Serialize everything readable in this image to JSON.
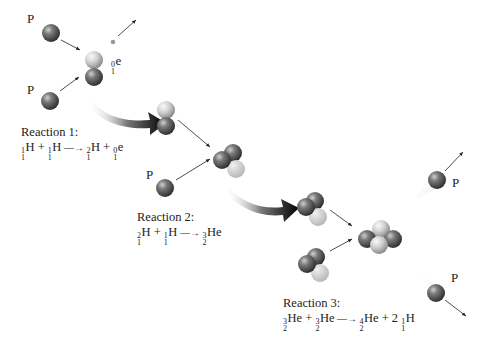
{
  "particle_labels": {
    "proton": "P",
    "positron_sup": "0",
    "positron_sub": "1",
    "positron_sym": "e"
  },
  "reactions": [
    {
      "label": "Reaction 1:",
      "terms": [
        {
          "coef": "",
          "sup": "1",
          "sub": "1",
          "sym": "H"
        },
        {
          "op": "+"
        },
        {
          "coef": "",
          "sup": "1",
          "sub": "1",
          "sym": "H"
        },
        {
          "op": "arrow"
        },
        {
          "coef": "",
          "sup": "2",
          "sub": "1",
          "sym": "H"
        },
        {
          "op": "+"
        },
        {
          "coef": "",
          "sup": "0",
          "sub": "1",
          "sym": "e"
        }
      ]
    },
    {
      "label": "Reaction 2:",
      "terms": [
        {
          "coef": "",
          "sup": "2",
          "sub": "1",
          "sym": "H"
        },
        {
          "op": "+"
        },
        {
          "coef": "",
          "sup": "1",
          "sub": "1",
          "sym": "H"
        },
        {
          "op": "arrow"
        },
        {
          "coef": "",
          "sup": "3",
          "sub": "2",
          "sym": "He"
        }
      ]
    },
    {
      "label": "Reaction 3:",
      "terms": [
        {
          "coef": "",
          "sup": "3",
          "sub": "2",
          "sym": "He"
        },
        {
          "op": "+"
        },
        {
          "coef": "",
          "sup": "3",
          "sub": "2",
          "sym": "He"
        },
        {
          "op": "arrow"
        },
        {
          "coef": "",
          "sup": "4",
          "sub": "2",
          "sym": "He"
        },
        {
          "op": "+"
        },
        {
          "coef": "2",
          "sup": "1",
          "sub": "1",
          "sym": "H"
        }
      ]
    }
  ],
  "colors": {
    "proton_dark": "#3e3e3e",
    "neutron_light": "#d8d8d8",
    "arrow": "#111111"
  }
}
